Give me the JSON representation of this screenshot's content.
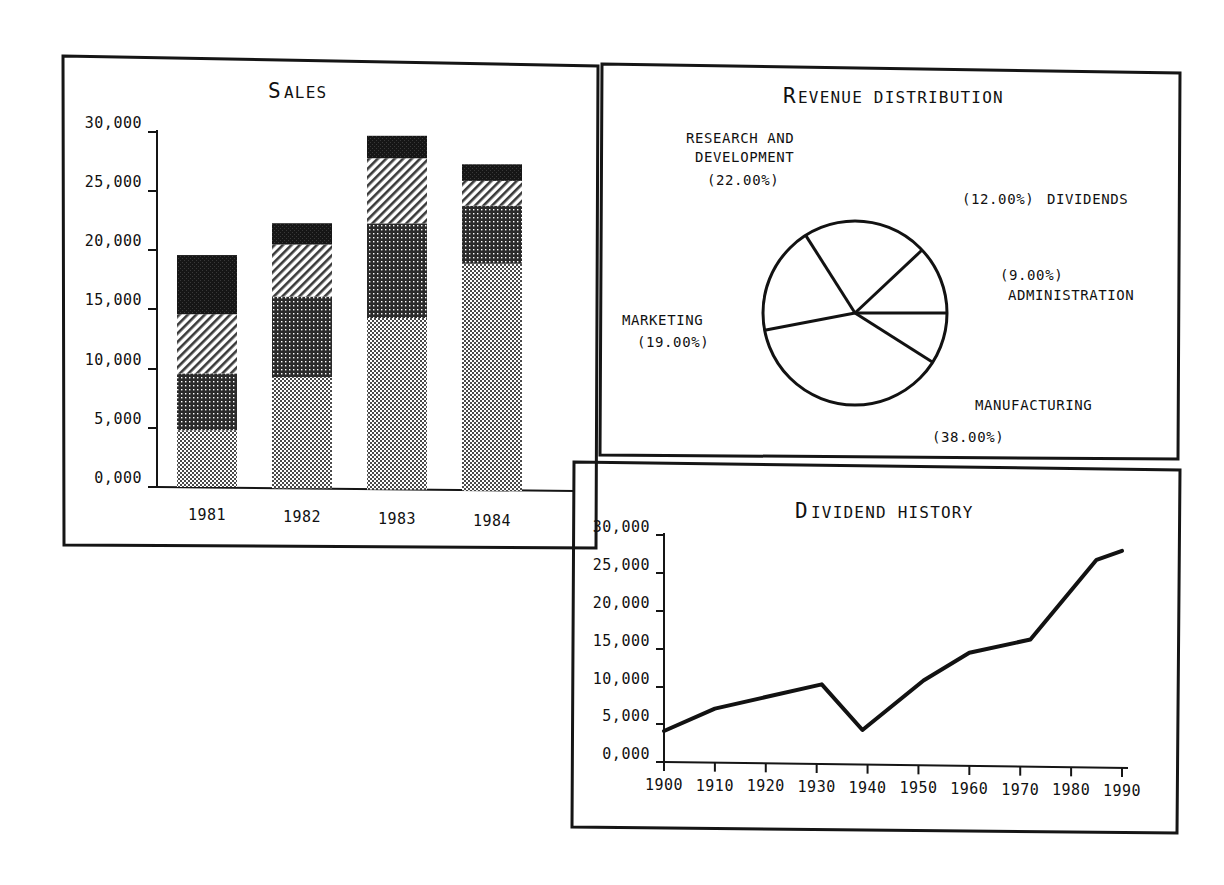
{
  "document": {
    "background_color": "#ffffff",
    "ink_color": "#101010",
    "panels": [
      {
        "name": "sales-panel",
        "title": "SALES"
      },
      {
        "name": "revenue-panel",
        "title": "REVENUE DISTRIBUTION"
      },
      {
        "name": "dividend-panel",
        "title": "DIVIDEND HISTORY"
      }
    ]
  },
  "chart_data": [
    {
      "id": "sales",
      "type": "bar",
      "stacked": true,
      "title": "SALES",
      "xlabel": "",
      "ylabel": "",
      "categories": [
        "1981",
        "1982",
        "1983",
        "1984"
      ],
      "ytick_labels": [
        "0,000",
        "5,000",
        "10,000",
        "15,000",
        "20,000",
        "25,000",
        "30,000"
      ],
      "ytick_values": [
        0,
        5000,
        10000,
        15000,
        20000,
        25000,
        30000
      ],
      "ylim": [
        0,
        30000
      ],
      "grid": false,
      "legend_position": "none",
      "series": [
        {
          "name": "segment-1",
          "fill": "light-dots",
          "values": [
            4800,
            9400,
            14500,
            19200
          ]
        },
        {
          "name": "segment-2",
          "fill": "dark-grid",
          "values": [
            4800,
            6800,
            8000,
            4900
          ]
        },
        {
          "name": "segment-3",
          "fill": "diagonal",
          "values": [
            5000,
            4400,
            5500,
            2100
          ]
        },
        {
          "name": "segment-4",
          "fill": "solid-black",
          "values": [
            5000,
            1800,
            1900,
            1400
          ]
        }
      ],
      "totals": [
        19600,
        22400,
        29900,
        27600
      ]
    },
    {
      "id": "revenue_distribution",
      "type": "pie",
      "title": "REVENUE DISTRIBUTION",
      "grid": false,
      "legend_position": "around-pie",
      "start_angle_deg": 0,
      "direction": "counterclockwise",
      "slices": [
        {
          "label": "DIVIDENDS",
          "value": 12.0,
          "value_text": "(12.00%)",
          "label_position": "upper-right"
        },
        {
          "label": "RESEARCH AND DEVELOPMENT",
          "value": 22.0,
          "value_text": "(22.00%)",
          "label_position": "upper-left"
        },
        {
          "label": "MARKETING",
          "value": 19.0,
          "value_text": "(19.00%)",
          "label_position": "left"
        },
        {
          "label": "MANUFACTURING",
          "value": 38.0,
          "value_text": "(38.00%)",
          "label_position": "lower-right"
        },
        {
          "label": "ADMINISTRATION",
          "value": 9.0,
          "value_text": "(9.00%)",
          "label_position": "right"
        }
      ]
    },
    {
      "id": "dividend_history",
      "type": "line",
      "title": "DIVIDEND HISTORY",
      "xlabel": "",
      "ylabel": "",
      "grid": false,
      "legend_position": "none",
      "xtick_labels": [
        "1900",
        "1910",
        "1920",
        "1930",
        "1940",
        "1950",
        "1960",
        "1970",
        "1980",
        "1990"
      ],
      "xtick_values": [
        1900,
        1910,
        1920,
        1930,
        1940,
        1950,
        1960,
        1970,
        1980,
        1990
      ],
      "xlim": [
        1900,
        1990
      ],
      "ytick_labels": [
        "0,000",
        "5,000",
        "10,000",
        "15,000",
        "20,000",
        "25,000",
        "30,000"
      ],
      "ytick_values": [
        0,
        5000,
        10000,
        15000,
        20000,
        25000,
        30000
      ],
      "ylim": [
        0,
        30000
      ],
      "x": [
        1900,
        1910,
        1931,
        1939,
        1951,
        1960,
        1972,
        1985,
        1990
      ],
      "y": [
        4100,
        7100,
        10400,
        4400,
        11000,
        14700,
        16500,
        27100,
        28300
      ]
    }
  ],
  "sales": {
    "title": "SALES",
    "ytick_labels": [
      "30,000",
      "25,000",
      "20,000",
      "15,000",
      "10,000",
      "5,000",
      "0,000"
    ],
    "cat_labels": [
      "1981",
      "1982",
      "1983",
      "1984"
    ]
  },
  "revenue": {
    "title": "REVENUE DISTRIBUTION",
    "labels": {
      "rd_line1": "RESEARCH AND",
      "rd_line2": "DEVELOPMENT",
      "rd_pct": "(22.00%)",
      "dividends_pct": "(12.00%)",
      "dividends_name": "DIVIDENDS",
      "admin_pct": "(9.00%)",
      "admin_name": "ADMINISTRATION",
      "marketing_name": "MARKETING",
      "marketing_pct": "(19.00%)",
      "manufacturing_name": "MANUFACTURING",
      "manufacturing_pct": "(38.00%)"
    }
  },
  "dividend": {
    "title": "DIVIDEND HISTORY",
    "ytick_labels": [
      "30,000",
      "25,000",
      "20,000",
      "15,000",
      "10,000",
      "5,000",
      "0,000"
    ],
    "xtick_labels": [
      "1900",
      "1910",
      "1920",
      "1930",
      "1940",
      "1950",
      "1960",
      "1970",
      "1980",
      "1990"
    ]
  }
}
